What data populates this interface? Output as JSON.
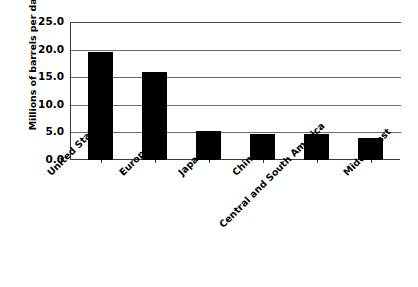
{
  "chart_data": {
    "type": "bar",
    "title": "",
    "subtitle": "",
    "xlabel": "",
    "ylabel": "Millions of barrels per day",
    "categories": [
      "United States",
      "Europe",
      "Japan",
      "China",
      "Central and South America",
      "Middle East"
    ],
    "values": [
      19.5,
      16.0,
      5.3,
      4.8,
      4.7,
      4.0
    ],
    "ylim": [
      0.0,
      25.0
    ],
    "ytick_labels": [
      "25.0",
      "20.0",
      "15.0",
      "10.0",
      "5.0",
      "0.0"
    ],
    "ytick_values": [
      25.0,
      20.0,
      15.0,
      10.0,
      5.0,
      0.0
    ],
    "grid": "horizontal",
    "legend": "none",
    "bar_color": "#000000",
    "background_color": "#ffffff",
    "axis_color": "#3a3a3a",
    "gridline_color": "#6d6d6d",
    "xtick_label_rotation": -45
  }
}
